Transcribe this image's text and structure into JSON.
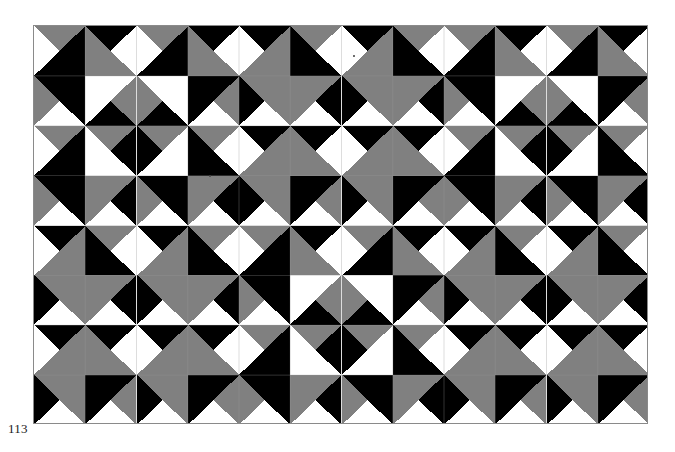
{
  "page": {
    "folio": "113",
    "background_color": "#ffffff",
    "width": 675,
    "height": 452
  },
  "plate": {
    "name": "quilt-pattern-plate",
    "left": 33,
    "top": 25,
    "width": 615,
    "height": 399,
    "border_color": "#8a8a8a",
    "block_columns": 3,
    "block_rows": 2,
    "block_width": 205,
    "block_height": 199.5,
    "units_per_block_side": 4
  },
  "palette": {
    "dark": "#000000",
    "light": "#ffffff",
    "medium_halftone": "#808080",
    "seam_line": "#9b9b9b",
    "plate_border": "#8a8a8a"
  },
  "legend": {
    "fabrics": [
      {
        "key": "D",
        "name": "dark",
        "color": "#000000"
      },
      {
        "key": "M",
        "name": "medium-halftone",
        "color": "#808080"
      },
      {
        "key": "L",
        "name": "light",
        "color": "#ffffff"
      }
    ]
  },
  "layout": {
    "block_arrangement": [
      [
        "A",
        "B",
        "A"
      ],
      [
        "B",
        "A",
        "B"
      ]
    ]
  },
  "blocks": {
    "A": {
      "name": "block-variant-a",
      "description": "Four-patch star block, dark center diamond",
      "units": [
        [
          {
            "d": "tl",
            "a": "M",
            "b": "D",
            "c": "L"
          },
          {
            "d": "tr",
            "a": "D",
            "b": "M",
            "c": "L"
          },
          {
            "d": "tl",
            "a": "M",
            "b": "D",
            "c": "L"
          },
          {
            "d": "tr",
            "a": "D",
            "b": "M",
            "c": "L"
          }
        ],
        [
          {
            "d": "bl",
            "a": "M",
            "b": "D",
            "c": "L"
          },
          {
            "d": "br",
            "a": "M",
            "b": "L",
            "c": "D"
          },
          {
            "d": "bl",
            "a": "M",
            "b": "L",
            "c": "D"
          },
          {
            "d": "br",
            "a": "M",
            "b": "D",
            "c": "L"
          }
        ],
        [
          {
            "d": "tl",
            "a": "M",
            "b": "D",
            "c": "L"
          },
          {
            "d": "tr",
            "a": "M",
            "b": "L",
            "c": "D"
          },
          {
            "d": "tl",
            "a": "M",
            "b": "L",
            "c": "D"
          },
          {
            "d": "tr",
            "a": "M",
            "b": "D",
            "c": "L"
          }
        ],
        [
          {
            "d": "bl",
            "a": "M",
            "b": "D",
            "c": "L"
          },
          {
            "d": "br",
            "a": "D",
            "b": "M",
            "c": "L"
          },
          {
            "d": "bl",
            "a": "M",
            "b": "D",
            "c": "L"
          },
          {
            "d": "br",
            "a": "D",
            "b": "M",
            "c": "L"
          }
        ]
      ]
    },
    "B": {
      "name": "block-variant-b",
      "description": "Four-patch star block, light center square, dark corner fans",
      "units": [
        [
          {
            "d": "tl",
            "a": "D",
            "b": "M",
            "c": "L"
          },
          {
            "d": "tr",
            "a": "M",
            "b": "D",
            "c": "L"
          },
          {
            "d": "tl",
            "a": "D",
            "b": "M",
            "c": "L"
          },
          {
            "d": "tr",
            "a": "M",
            "b": "D",
            "c": "L"
          }
        ],
        [
          {
            "d": "bl",
            "a": "D",
            "b": "M",
            "c": "L"
          },
          {
            "d": "br",
            "a": "D",
            "b": "M",
            "c": "L"
          },
          {
            "d": "bl",
            "a": "D",
            "b": "M",
            "c": "L"
          },
          {
            "d": "br",
            "a": "D",
            "b": "M",
            "c": "L"
          }
        ],
        [
          {
            "d": "tl",
            "a": "D",
            "b": "M",
            "c": "L"
          },
          {
            "d": "tr",
            "a": "D",
            "b": "M",
            "c": "L"
          },
          {
            "d": "tl",
            "a": "D",
            "b": "M",
            "c": "L"
          },
          {
            "d": "tr",
            "a": "D",
            "b": "M",
            "c": "L"
          }
        ],
        [
          {
            "d": "bl",
            "a": "D",
            "b": "M",
            "c": "L"
          },
          {
            "d": "br",
            "a": "M",
            "b": "D",
            "c": "L"
          },
          {
            "d": "bl",
            "a": "D",
            "b": "M",
            "c": "L"
          },
          {
            "d": "br",
            "a": "M",
            "b": "D",
            "c": "L"
          }
        ]
      ]
    }
  },
  "seams": {
    "description": "faint hairline piecing seams visible inside light centers",
    "horizontal_rows": [
      1,
      2,
      3
    ],
    "vertical_cols": [
      1,
      2,
      3
    ]
  },
  "specks": [
    {
      "x": 176,
      "y": 150,
      "r": 1.2
    },
    {
      "x": 320,
      "y": 30,
      "r": 0.9
    }
  ]
}
